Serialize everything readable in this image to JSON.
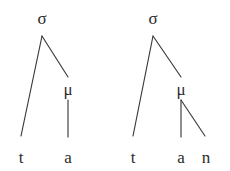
{
  "figure": {
    "background_color": "#ffffff",
    "stroke_color": "#3a3a3a",
    "text_color": "#2b2b2b",
    "type": "syllable-structure-trees",
    "tree_count": 2
  },
  "trees": [
    {
      "name": "light-syllable-ta",
      "root": {
        "label": "σ",
        "x": 42,
        "y": 24
      },
      "mora": {
        "label": "μ",
        "x": 68,
        "y": 95
      },
      "segments": [
        {
          "label": "t",
          "x": 21,
          "y": 163
        },
        {
          "label": "a",
          "x": 68,
          "y": 163
        }
      ],
      "branches": [
        {
          "name": "sigma-to-onset",
          "x1": 42,
          "y1": 36,
          "x2": 21,
          "y2": 136
        },
        {
          "name": "sigma-to-mora",
          "x1": 42,
          "y1": 36,
          "x2": 68,
          "y2": 77
        },
        {
          "name": "mora-to-nucleus",
          "x1": 68,
          "y1": 100,
          "x2": 68,
          "y2": 137
        }
      ]
    },
    {
      "name": "heavy-syllable-tan",
      "root": {
        "label": "σ",
        "x": 153,
        "y": 24
      },
      "mora": {
        "label": "μ",
        "x": 181,
        "y": 95
      },
      "segments": [
        {
          "label": "t",
          "x": 133,
          "y": 163
        },
        {
          "label": "a",
          "x": 181,
          "y": 163
        },
        {
          "label": "n",
          "x": 206,
          "y": 163
        }
      ],
      "branches": [
        {
          "name": "sigma-to-onset",
          "x1": 153,
          "y1": 36,
          "x2": 133,
          "y2": 136
        },
        {
          "name": "sigma-to-mora",
          "x1": 153,
          "y1": 36,
          "x2": 181,
          "y2": 77
        },
        {
          "name": "mora-to-nucleus",
          "x1": 181,
          "y1": 100,
          "x2": 181,
          "y2": 137
        },
        {
          "name": "mora-to-coda",
          "x1": 181,
          "y1": 100,
          "x2": 205,
          "y2": 136
        }
      ]
    }
  ]
}
